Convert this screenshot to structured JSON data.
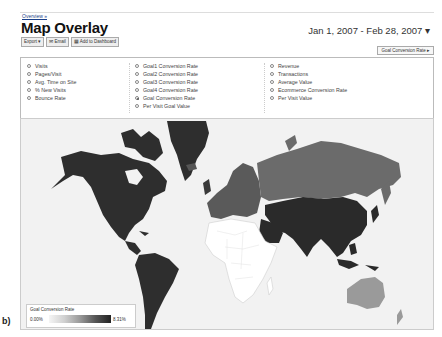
{
  "header": {
    "breadcrumb": "Overview »",
    "title": "Map Overlay",
    "date_range": "Jan 1, 2007 - Feb 28, 2007 ▾"
  },
  "toolbar": {
    "export_label": "Export ▾",
    "email_label": "✉ Email",
    "dashboard_label": "▦ Add to Dashboard"
  },
  "metric_select": {
    "selected": "Goal Conversion Rate ▸"
  },
  "metrics": {
    "col1": [
      {
        "label": "Visits",
        "selected": false
      },
      {
        "label": "Pages/Visit",
        "selected": false
      },
      {
        "label": "Avg. Time on Site",
        "selected": false
      },
      {
        "label": "% New Visits",
        "selected": false
      },
      {
        "label": "Bounce Rate",
        "selected": false
      }
    ],
    "col2": [
      {
        "label": "Goal1 Conversion Rate",
        "selected": false
      },
      {
        "label": "Goal2 Conversion Rate",
        "selected": false
      },
      {
        "label": "Goal3 Conversion Rate",
        "selected": false
      },
      {
        "label": "Goal4 Conversion Rate",
        "selected": false
      },
      {
        "label": "Goal Conversion Rate",
        "selected": true
      },
      {
        "label": "Per Visit Goal Value",
        "selected": false
      }
    ],
    "col3": [
      {
        "label": "Revenue",
        "selected": false
      },
      {
        "label": "Transactions",
        "selected": false
      },
      {
        "label": "Average Value",
        "selected": false
      },
      {
        "label": "Ecommerce Conversion Rate",
        "selected": false
      },
      {
        "label": "Per Visit Value",
        "selected": false
      }
    ]
  },
  "legend": {
    "title": "Goal Conversion Rate",
    "min": "0.00%",
    "max": "8.31%"
  },
  "map": {
    "colors": {
      "ocean": "#f2f2f2",
      "darkest": "#2b2b2b",
      "dark": "#3a3a3a",
      "medium": "#6b6b6b",
      "light": "#9a9a9a",
      "nodata": "#ffffff"
    }
  },
  "figure_label": "b)"
}
